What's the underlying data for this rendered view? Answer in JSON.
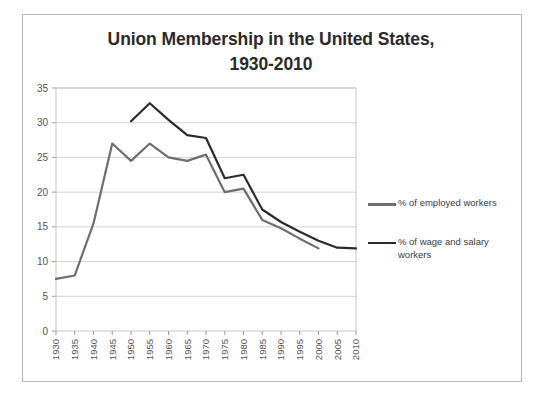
{
  "chart_data": {
    "type": "line",
    "title": "Union Membership in the United States, 1930-2010",
    "title_line_1": "Union Membership in the United States,",
    "title_line_2": "1930-2010",
    "xlabel": "",
    "ylabel": "",
    "xlim": [
      1930,
      2010
    ],
    "ylim": [
      0,
      35
    ],
    "ytick_step": 5,
    "grid": true,
    "grid_axis": "y",
    "legend_position": "right",
    "categories": [
      1930,
      1935,
      1940,
      1945,
      1950,
      1955,
      1960,
      1965,
      1970,
      1975,
      1980,
      1985,
      1990,
      1995,
      2000,
      2005,
      2010
    ],
    "xtick_labels": [
      "1930",
      "1935",
      "1940",
      "1945",
      "1950",
      "1955",
      "1960",
      "1965",
      "1970",
      "1975",
      "1980",
      "1985",
      "1990",
      "1995",
      "2000",
      "2005",
      "2010"
    ],
    "ytick_labels": [
      "0",
      "5",
      "10",
      "15",
      "20",
      "25",
      "30",
      "35"
    ],
    "series": [
      {
        "name": "% of employed workers",
        "color": "#6e6e6e",
        "x": [
          1930,
          1935,
          1940,
          1945,
          1950,
          1955,
          1960,
          1965,
          1970,
          1975,
          1980,
          1985,
          1990,
          1995,
          2000
        ],
        "values": [
          7.5,
          8.0,
          15.5,
          27.0,
          24.5,
          27.0,
          25.0,
          24.5,
          25.4,
          20.0,
          20.5,
          16.0,
          14.8,
          13.3,
          11.9
        ]
      },
      {
        "name": "% of wage and salary workers",
        "color": "#2b2b2b",
        "x": [
          1950,
          1955,
          1960,
          1965,
          1970,
          1975,
          1980,
          1985,
          1990,
          1995,
          2000,
          2005,
          2010
        ],
        "values": [
          30.2,
          32.8,
          30.4,
          28.2,
          27.8,
          22.0,
          22.5,
          17.5,
          15.7,
          14.3,
          13.0,
          12.0,
          11.9
        ]
      }
    ]
  },
  "legend": {
    "entries": [
      {
        "label": "% of employed workers",
        "color": "#6e6e6e"
      },
      {
        "label": "% of wage and salary workers",
        "color": "#2b2b2b"
      }
    ]
  }
}
